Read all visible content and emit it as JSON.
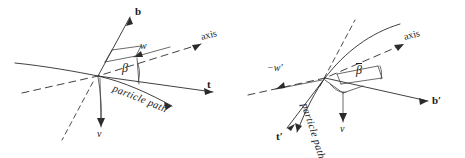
{
  "figure": {
    "type": "vector-diagram",
    "background_color": "#ffffff",
    "ink_color": "#2b2b2b"
  },
  "panels": [
    {
      "id": "left-panel",
      "name": "unprimed-frame",
      "origin": {
        "x": 98,
        "y": 76
      },
      "labels": {
        "binormal": "b",
        "relative_velocity": "w",
        "axis": "axis",
        "angle": "β",
        "path": "particle path",
        "tangent": "t",
        "velocity": "v"
      }
    },
    {
      "id": "right-panel",
      "name": "primed-frame",
      "origin": {
        "x": 325,
        "y": 78
      },
      "labels": {
        "relative_velocity": "−w′",
        "axis": "axis",
        "angle": "β",
        "path": "particle path",
        "tangent": "t′",
        "velocity": "v",
        "binormal": "b′"
      }
    }
  ],
  "colors": {
    "ink": "#2b2b2b",
    "paper": "#ffffff"
  }
}
